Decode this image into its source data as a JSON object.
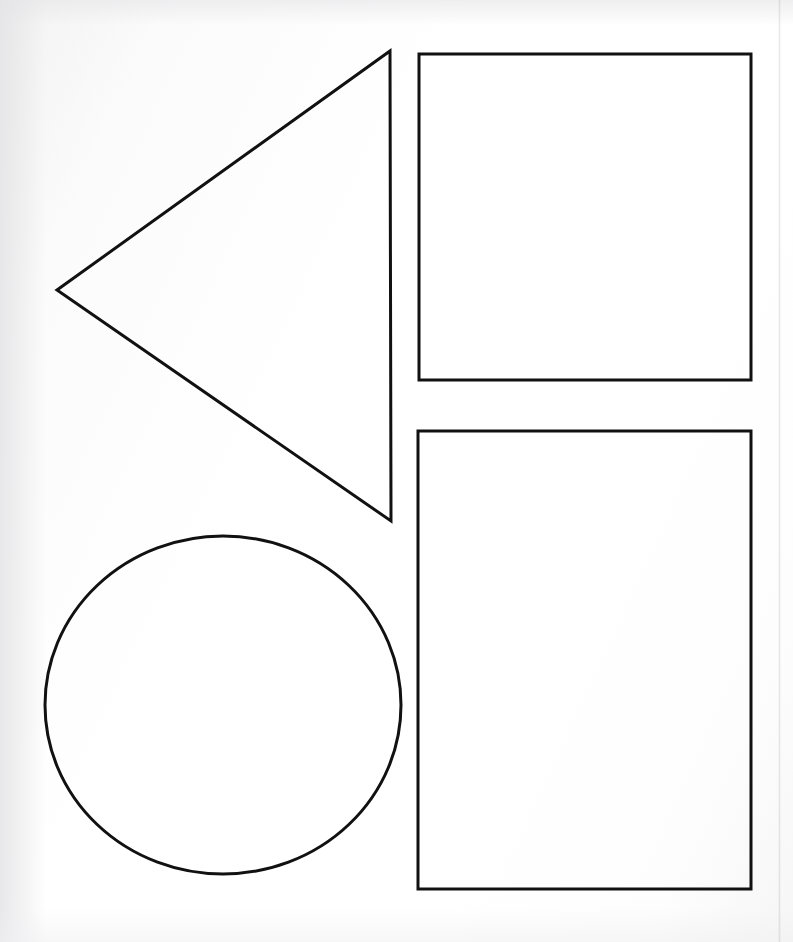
{
  "page": {
    "width": 793,
    "height": 942,
    "background_color": "#fcfcfc",
    "ink_color": "#111111",
    "medium": "scanned paper line drawing",
    "shape_count": 4
  },
  "artifacts": {
    "scan_seam": {
      "name": "vertical-scan-seam",
      "x": 779,
      "color": "#78787d",
      "visible": true
    },
    "paper_shading": {
      "left_edge": true,
      "top_edge": true,
      "bottom_edge": true
    }
  },
  "shapes": [
    {
      "id": "triangle",
      "label": "Triangle",
      "kind": "triangle",
      "orientation": "pointing-left",
      "stroke_color": "#111111",
      "stroke_width": 3,
      "fill": "none",
      "points": "390,51 391,521 57,290",
      "vertices": [
        {
          "name": "top-right",
          "x": 390,
          "y": 51
        },
        {
          "name": "bottom-right",
          "x": 391,
          "y": 521
        },
        {
          "name": "left-point",
          "x": 57,
          "y": 290
        }
      ],
      "bbox": {
        "x": 57,
        "y": 51,
        "width": 334,
        "height": 470
      }
    },
    {
      "id": "square-top-right",
      "label": "Square",
      "kind": "rectangle",
      "orientation": "upright",
      "stroke_color": "#111111",
      "stroke_width": 3,
      "fill": "none",
      "rect": {
        "x": 419,
        "y": 54,
        "width": 332,
        "height": 326
      },
      "bbox": {
        "x": 419,
        "y": 54,
        "width": 332,
        "height": 326
      }
    },
    {
      "id": "rectangle-bottom-right",
      "label": "Rectangle",
      "kind": "rectangle",
      "orientation": "portrait",
      "stroke_color": "#111111",
      "stroke_width": 3,
      "fill": "none",
      "rect": {
        "x": 418,
        "y": 431,
        "width": 333,
        "height": 458
      },
      "bbox": {
        "x": 418,
        "y": 431,
        "width": 333,
        "height": 458
      }
    },
    {
      "id": "circle-bottom-left",
      "label": "Circle",
      "kind": "ellipse",
      "orientation": "upright",
      "stroke_color": "#111111",
      "stroke_width": 3,
      "fill": "none",
      "ellipse": {
        "cx": 223,
        "cy": 705,
        "rx": 178,
        "ry": 169
      },
      "bbox": {
        "x": 45,
        "y": 536,
        "width": 356,
        "height": 338
      }
    }
  ]
}
